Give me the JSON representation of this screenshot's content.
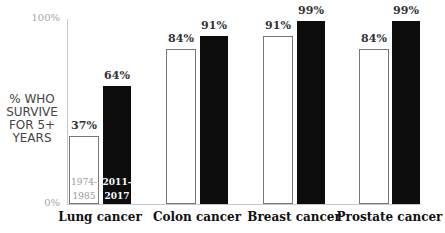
{
  "chart_data": {
    "type": "bar",
    "title": "",
    "ylabel": "% WHO SURVIVE FOR 5+ YEARS",
    "xlabel": "",
    "ylim": [
      0,
      100
    ],
    "y_ticks": [
      "0%",
      "100%"
    ],
    "grid": false,
    "categories": [
      "Lung cancer",
      "Colon cancer",
      "Breast cancer",
      "Prostate cancer"
    ],
    "series": [
      {
        "name": "1974-1985",
        "color": "#ffffff",
        "values": [
          37,
          84,
          91,
          84
        ],
        "labels": [
          "37%",
          "84%",
          "91%",
          "84%"
        ]
      },
      {
        "name": "2011-2017",
        "color": "#0d0d0d",
        "values": [
          64,
          91,
          99,
          99
        ],
        "labels": [
          "64%",
          "91%",
          "99%",
          "99%"
        ]
      }
    ],
    "legend_inline": {
      "old": [
        "1974-",
        "1985"
      ],
      "new": [
        "2011-",
        "2017"
      ]
    }
  }
}
